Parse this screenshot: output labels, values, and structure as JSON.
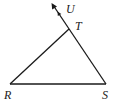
{
  "figure": {
    "type": "triangle-with-exterior-ray",
    "stroke_color": "#1a1a1a",
    "points": {
      "R": {
        "label": "R",
        "x": 10,
        "y": 84
      },
      "S": {
        "label": "S",
        "x": 106,
        "y": 84
      },
      "T": {
        "label": "T",
        "x": 69,
        "y": 29
      },
      "U": {
        "label": "U",
        "x": 52,
        "y": 4
      }
    },
    "segments": [
      "RT",
      "RS",
      "ST"
    ],
    "rays": [
      "SU through T"
    ]
  }
}
